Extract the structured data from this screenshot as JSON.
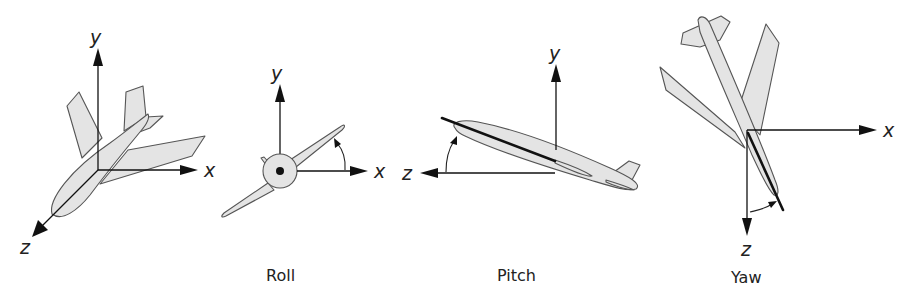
{
  "figure": {
    "panels": [
      {
        "id": "axes",
        "caption": "",
        "axis_labels": {
          "y": "y",
          "x": "x",
          "z": "z"
        }
      },
      {
        "id": "roll",
        "caption": "Roll",
        "axis_labels": {
          "y": "y",
          "x": "x"
        }
      },
      {
        "id": "pitch",
        "caption": "Pitch",
        "axis_labels": {
          "y": "y",
          "z": "z"
        }
      },
      {
        "id": "yaw",
        "caption": "Yaw",
        "axis_labels": {
          "x": "x",
          "z": "z"
        }
      }
    ],
    "colors": {
      "aircraft_fill": "#e4e4e4",
      "aircraft_outline": "#555555",
      "axis": "#111111",
      "background": "#ffffff"
    }
  }
}
